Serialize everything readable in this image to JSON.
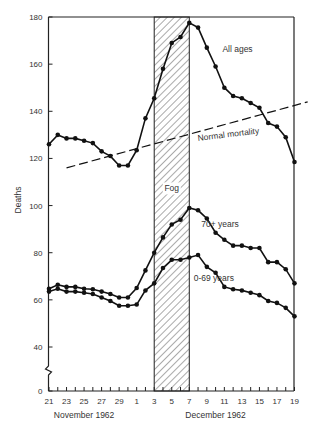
{
  "chart_data": {
    "type": "line",
    "title": "",
    "xlabel_groups": [
      {
        "label": "November 1962",
        "center_day_index": 4
      },
      {
        "label": "December 1962",
        "center_day_index": 19
      }
    ],
    "ylabel": "Deaths",
    "ylim": [
      0,
      180
    ],
    "y_axis_break": {
      "between": [
        0,
        40
      ]
    },
    "y_ticks": [
      0,
      40,
      60,
      80,
      100,
      120,
      140,
      160,
      180
    ],
    "x_tick_labels": [
      "21",
      "23",
      "25",
      "27",
      "29",
      "1",
      "3",
      "5",
      "7",
      "9",
      "11",
      "13",
      "15",
      "17",
      "19"
    ],
    "x": [
      "Nov 21",
      "Nov 22",
      "Nov 23",
      "Nov 24",
      "Nov 25",
      "Nov 26",
      "Nov 27",
      "Nov 28",
      "Nov 29",
      "Nov 30",
      "Dec 1",
      "Dec 2",
      "Dec 3",
      "Dec 4",
      "Dec 5",
      "Dec 6",
      "Dec 7",
      "Dec 8",
      "Dec 9",
      "Dec 10",
      "Dec 11",
      "Dec 12",
      "Dec 13",
      "Dec 14",
      "Dec 15",
      "Dec 16",
      "Dec 17",
      "Dec 18",
      "Dec 19"
    ],
    "series": [
      {
        "name": "All ages",
        "values": [
          126,
          130,
          128.5,
          128.5,
          127.5,
          126.5,
          123,
          121,
          117,
          117,
          123.5,
          137,
          145.5,
          158,
          169,
          171.5,
          177.5,
          175.5,
          167,
          159,
          150,
          146.5,
          145.5,
          143.5,
          141.5,
          135,
          133.5,
          129,
          118.5
        ]
      },
      {
        "name": "70+ years",
        "values": [
          64.7,
          66.4,
          65.5,
          65.5,
          64.7,
          64.5,
          63.5,
          62.5,
          61,
          61,
          65,
          72.5,
          80,
          86.5,
          92,
          94,
          99,
          98,
          94.5,
          88.5,
          85.5,
          83,
          83,
          82,
          82,
          76,
          76,
          73,
          67
        ]
      },
      {
        "name": "0-69 years",
        "values": [
          63.5,
          64.7,
          63.5,
          63.5,
          63,
          62.5,
          61,
          59.5,
          57.5,
          57.5,
          58,
          64,
          67,
          73.5,
          77,
          77,
          78,
          79,
          74,
          71.5,
          65.5,
          64.5,
          64,
          63,
          62,
          59.5,
          58.7,
          56.6,
          53
        ]
      }
    ],
    "reference_lines": [
      {
        "name": "Normal mortality",
        "style": "dashed",
        "start": {
          "day_index": 2,
          "value": 116
        },
        "end": {
          "day_index": 29.5,
          "value": 144
        }
      }
    ],
    "shaded_regions": [
      {
        "label": "Fog",
        "from_day_index": 12,
        "to_day_index": 16,
        "pattern": "diagonal-hatch"
      }
    ],
    "annotations": [
      {
        "text": "All ages",
        "day_index": 21.5,
        "value": 165
      },
      {
        "text": "Normal mortality",
        "day_index": 20.5,
        "value": 129,
        "rotation": -7
      },
      {
        "text": "70+ years",
        "day_index": 19.5,
        "value": 91
      },
      {
        "text": "0-69 years",
        "day_index": 18.8,
        "value": 68
      },
      {
        "text": "Fog",
        "day_index": 14,
        "value": 106
      }
    ],
    "grid": false,
    "legend": "inline-labels"
  },
  "colors": {
    "line": "#111111",
    "axis": "#222222",
    "hatch": "#555555",
    "background": "#ffffff"
  }
}
